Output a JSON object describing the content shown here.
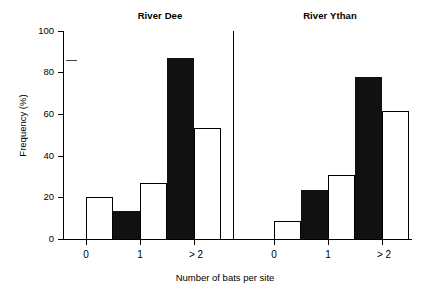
{
  "chart_data": {
    "type": "bar",
    "title": "",
    "xlabel": "Number of bats per site",
    "ylabel": "Frequency (%)",
    "ylim": [
      0,
      100
    ],
    "yticks": [
      0,
      20,
      40,
      60,
      80,
      100
    ],
    "ytick_labels": [
      "0",
      "20",
      "40",
      "60",
      "80",
      "100"
    ],
    "categories": [
      "0",
      "1",
      "> 2"
    ],
    "grid": false,
    "legend": "none",
    "panels": [
      {
        "title": "River Dee",
        "categories": [
          "0",
          "1",
          "> 2"
        ],
        "series": [
          {
            "name": "filled",
            "values": [
              0,
              13.5,
              87
            ]
          },
          {
            "name": "open",
            "values": [
              20,
              27,
              53.5
            ]
          }
        ]
      },
      {
        "title": "River Ythan",
        "categories": [
          "0",
          "1",
          "> 2"
        ],
        "series": [
          {
            "name": "filled",
            "values": [
              0,
              23.5,
              78
            ]
          },
          {
            "name": "open",
            "values": [
              8.5,
              31,
              61.5
            ]
          }
        ]
      }
    ]
  },
  "axes": {
    "ylabel": "Frequency (%)",
    "xlabel": "Number of bats per site",
    "ytick_0": "0",
    "ytick_20": "20",
    "ytick_40": "40",
    "ytick_60": "60",
    "ytick_80": "80",
    "ytick_100": "100"
  },
  "panel_left": {
    "title": "River Dee",
    "cat_0": "0",
    "cat_1": "1",
    "cat_2": "> 2"
  },
  "panel_right": {
    "title": "River Ythan",
    "cat_0": "0",
    "cat_1": "1",
    "cat_2": "> 2"
  }
}
